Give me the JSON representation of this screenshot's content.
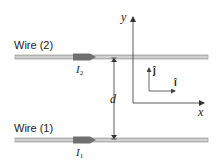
{
  "diagram": {
    "wires": [
      {
        "id": "wire-2",
        "label": "Wire (2)",
        "current_symbol": "I",
        "current_subscript": "2"
      },
      {
        "id": "wire-1",
        "label": "Wire (1)",
        "current_symbol": "I",
        "current_subscript": "1"
      }
    ],
    "separation_label": "d",
    "axes": {
      "x_label": "x",
      "y_label": "y"
    },
    "unit_vectors": {
      "i": "î",
      "j": "ĵ"
    },
    "colors": {
      "wire": "#b5b5b5",
      "wire_edge": "#8a8a8a",
      "current_arrow": "#6f6f6f",
      "lines": "#333333"
    }
  }
}
